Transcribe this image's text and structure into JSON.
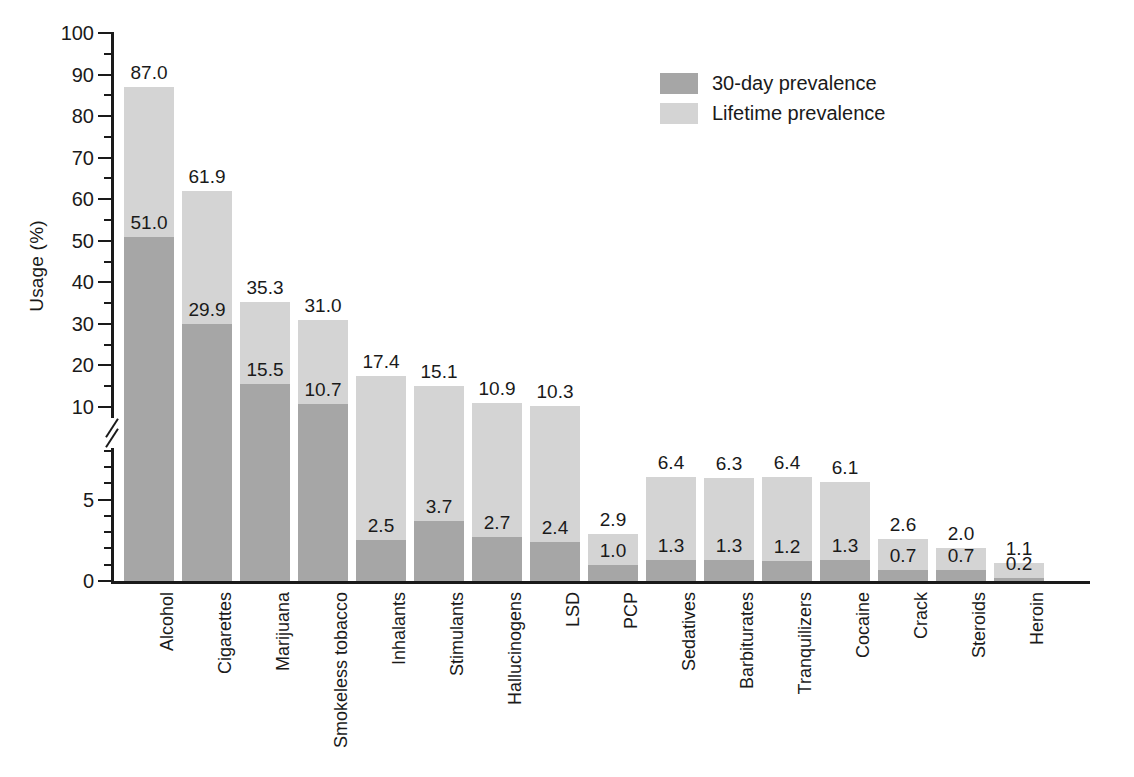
{
  "chart_data": {
    "type": "bar",
    "subtype": "overlapping-grouped",
    "title": "",
    "xlabel": "",
    "ylabel": "Usage (%)",
    "grid": false,
    "legend_position": "top-right",
    "axis_break": true,
    "axis_break_note": "y-axis is broken between 10 and 10; lower section 0-10 uses an expanded scale with ticks every 1 and labels at 0 and 5",
    "ylim": [
      0,
      100
    ],
    "y_ticks_major_upper": [
      10,
      20,
      30,
      40,
      50,
      60,
      70,
      80,
      90,
      100
    ],
    "y_ticks_major_lower": [
      0,
      5
    ],
    "categories": [
      "Alcohol",
      "Cigarettes",
      "Marijuana",
      "Smokeless tobacco",
      "Inhalants",
      "Stimulants",
      "Hallucinogens",
      "LSD",
      "PCP",
      "Sedatives",
      "Barbiturates",
      "Tranquilizers",
      "Cocaine",
      "Crack",
      "Steroids",
      "Heroin"
    ],
    "series": [
      {
        "name": "Lifetime prevalence",
        "color": "#d4d4d4",
        "values": [
          87.0,
          61.9,
          35.3,
          31.0,
          17.4,
          15.1,
          10.9,
          10.3,
          2.9,
          6.4,
          6.3,
          6.4,
          6.1,
          2.6,
          2.0,
          1.1
        ]
      },
      {
        "name": "30-day prevalence",
        "color": "#a6a6a6",
        "values": [
          51.0,
          29.9,
          15.5,
          10.7,
          2.5,
          3.7,
          2.7,
          2.4,
          1.0,
          1.3,
          1.3,
          1.2,
          1.3,
          0.7,
          0.7,
          0.2
        ]
      }
    ],
    "value_labels": {
      "lifetime": [
        "87.0",
        "61.9",
        "35.3",
        "31.0",
        "17.4",
        "15.1",
        "10.9",
        "10.3",
        "2.9",
        "6.4",
        "6.3",
        "6.4",
        "6.1",
        "2.6",
        "2.0",
        "1.1"
      ],
      "thirty_day": [
        "51.0",
        "29.9",
        "15.5",
        "10.7",
        "2.5",
        "3.7",
        "2.7",
        "2.4",
        "1.0",
        "1.3",
        "1.3",
        "1.2",
        "1.3",
        "0.7",
        "0.7",
        "0.2"
      ]
    }
  },
  "axis": {
    "y_title": "Usage (%)",
    "y_tick_labels_upper": [
      "100",
      "90",
      "80",
      "70",
      "60",
      "50",
      "40",
      "30",
      "20",
      "10"
    ],
    "y_tick_labels_lower": [
      "5",
      "0"
    ]
  },
  "legend": {
    "items": [
      {
        "label": "30-day prevalence",
        "swatch": "thirty",
        "color": "#a6a6a6"
      },
      {
        "label": "Lifetime prevalence",
        "swatch": "lifetime",
        "color": "#d4d4d4"
      }
    ]
  }
}
